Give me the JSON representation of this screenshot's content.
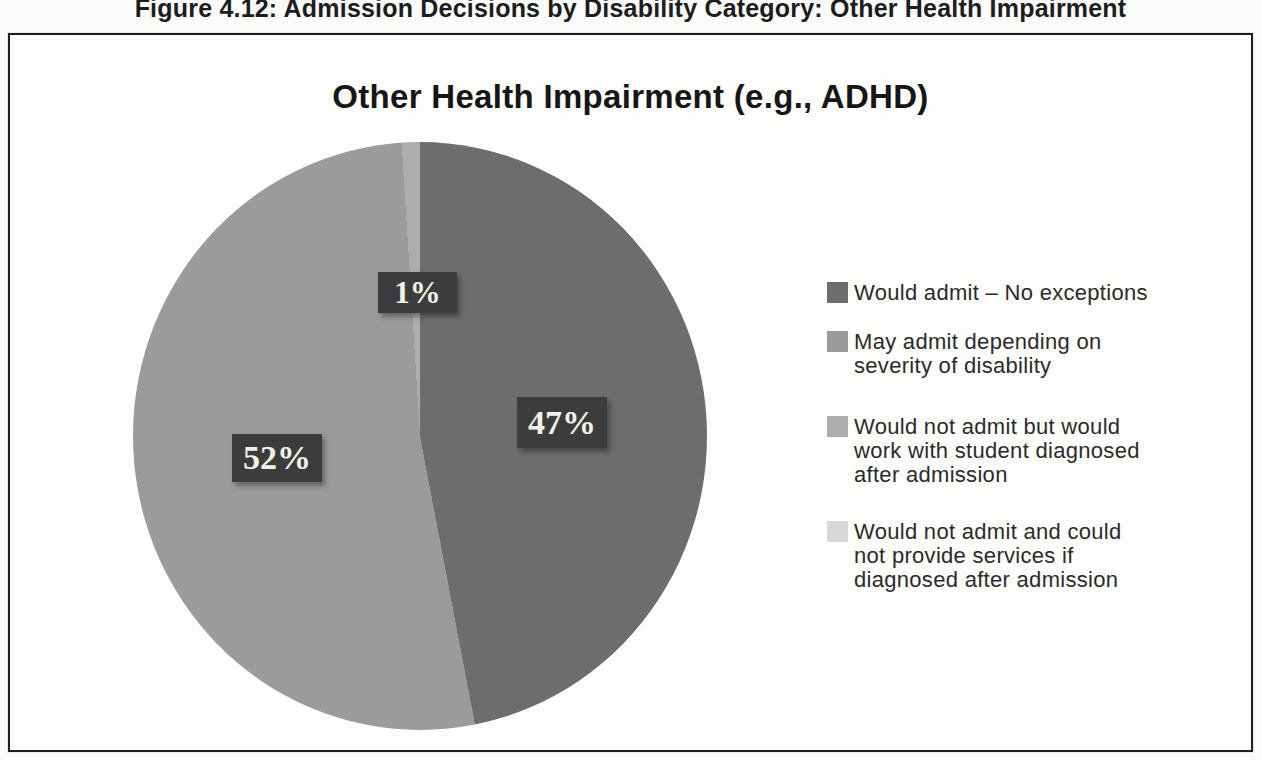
{
  "figure": {
    "caption": "Figure 4.12: Admission Decisions by Disability Category: Other Health Impairment"
  },
  "chart_data": {
    "type": "pie",
    "title": "Other Health Impairment (e.g., ADHD)",
    "unit": "percent",
    "start_angle_deg": 0,
    "direction": "clockwise",
    "legend_position": "right",
    "value_label_style": {
      "box_color": "#3c3c3c",
      "text_color": "#f2f1e8"
    },
    "slices": [
      {
        "label": "Would admit – No exceptions",
        "value": 47,
        "display": "47%",
        "color": "#6d6d6d",
        "legend_lines": [
          "Would admit – No exceptions"
        ]
      },
      {
        "label": "May admit depending on severity of disability",
        "value": 52,
        "display": "52%",
        "color": "#9b9b9b",
        "legend_lines": [
          "May admit depending on",
          "severity of disability"
        ]
      },
      {
        "label": "Would not admit but would work with student diagnosed after admission",
        "value": 1,
        "display": "1%",
        "color": "#adadad",
        "legend_lines": [
          "Would not admit but would",
          "work with student diagnosed",
          "after admission"
        ]
      },
      {
        "label": "Would not admit and could not provide services if diagnosed after admission",
        "value": 0,
        "display": "",
        "color": "#d8d8d8",
        "legend_lines": [
          "Would not admit and could",
          "not provide services if",
          "diagnosed after admission"
        ]
      }
    ]
  }
}
